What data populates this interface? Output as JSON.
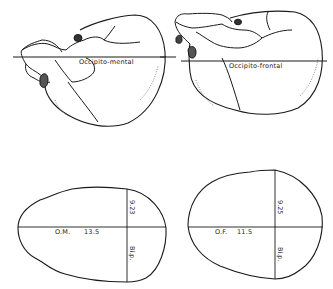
{
  "figure": {
    "top_left": {
      "title": "Skull lateral view with occipito-mental diameter",
      "line_label": "Occipito-mental"
    },
    "top_right": {
      "title": "Skull lateral view with occipito-frontal diameter",
      "line_label": "Occipito-frontal"
    },
    "bottom_left": {
      "title": "Outline section on occipito-mental plane",
      "horizontal_label": "O.M.",
      "horizontal_value": "13.5",
      "vertical_value": "9.23",
      "vertical_label": "Bi.p."
    },
    "bottom_right": {
      "title": "Outline section on occipito-frontal plane",
      "horizontal_label": "O.F.",
      "horizontal_value": "11.5",
      "vertical_value": "9.25",
      "vertical_label": "Bi.p."
    }
  },
  "colors": {
    "ink": "#1a1a1a",
    "background": "#ffffff"
  }
}
